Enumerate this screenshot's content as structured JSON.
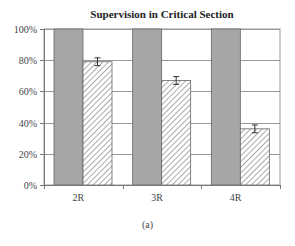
{
  "chart_data": {
    "type": "bar",
    "title": "Supervision in Critical Section",
    "caption": "(a)",
    "xlabel": "",
    "ylabel": "",
    "categories": [
      "2R",
      "3R",
      "4R"
    ],
    "series": [
      {
        "name": "series-1",
        "style": "solid-gray",
        "color": "#a6a6a6",
        "values": [
          100,
          100,
          100
        ]
      },
      {
        "name": "series-2",
        "style": "hatched",
        "color": "#ffffff",
        "values": [
          79,
          67,
          36
        ],
        "error": [
          2.5,
          2.5,
          2.5
        ]
      }
    ],
    "ylim": [
      0,
      100
    ],
    "yticks": [
      "0%",
      "20%",
      "40%",
      "60%",
      "80%",
      "100%"
    ],
    "grid": true,
    "legend": "none"
  }
}
